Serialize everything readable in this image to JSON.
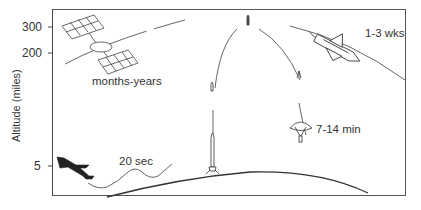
{
  "axis": {
    "title": "Altitude (miles)",
    "ticks": [
      {
        "label": "300",
        "y": 27
      },
      {
        "label": "200",
        "y": 53
      },
      {
        "label": "5",
        "y": 166
      }
    ]
  },
  "annotations": {
    "satellite": "months-years",
    "shuttle": "1-3 wks",
    "sounding_rocket": "7-14 min",
    "aircraft": "20 sec"
  },
  "icons": {
    "satellite": "satellite-icon",
    "shuttle": "space-shuttle-icon",
    "rocket": "sounding-rocket-icon",
    "parachute": "parachute-capsule-icon",
    "aircraft": "aircraft-icon"
  },
  "colors": {
    "line": "#444444",
    "text": "#333333",
    "background": "#ffffff"
  }
}
